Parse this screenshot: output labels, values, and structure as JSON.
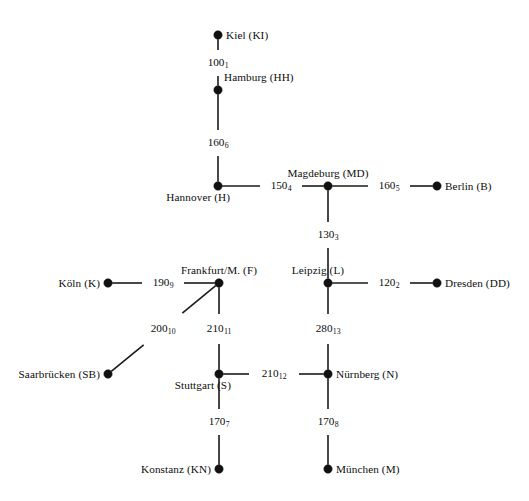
{
  "figure": {
    "kind": "undirected-weighted-graph",
    "width": 529,
    "height": 501,
    "background_color": "#ffffff",
    "line_color": "#1a1a1a",
    "node_color": "#111111",
    "text_color": "#0d0d0d"
  },
  "nodes": [
    {
      "id": "KI",
      "label": "Kiel (KI)",
      "x": 218,
      "y": 35,
      "label_pos": "right"
    },
    {
      "id": "HH",
      "label": "Hamburg (HH)",
      "x": 218,
      "y": 90,
      "label_pos": "right-above"
    },
    {
      "id": "H",
      "label": "Hannover (H)",
      "x": 218,
      "y": 186,
      "label_pos": "below-left"
    },
    {
      "id": "MD",
      "label": "Magdeburg (MD)",
      "x": 328,
      "y": 186,
      "label_pos": "above"
    },
    {
      "id": "B",
      "label": "Berlin (B)",
      "x": 437,
      "y": 186,
      "label_pos": "right"
    },
    {
      "id": "K",
      "label": "Köln (K)",
      "x": 108,
      "y": 283,
      "label_pos": "left"
    },
    {
      "id": "F",
      "label": "Frankfurt/M. (F)",
      "x": 219,
      "y": 283,
      "label_pos": "above"
    },
    {
      "id": "L",
      "label": "Leipzig (L)",
      "x": 328,
      "y": 283,
      "label_pos": "above-left"
    },
    {
      "id": "DD",
      "label": "Dresden (DD)",
      "x": 437,
      "y": 283,
      "label_pos": "right"
    },
    {
      "id": "SB",
      "label": "Saarbrücken (SB)",
      "x": 108,
      "y": 374,
      "label_pos": "left"
    },
    {
      "id": "S",
      "label": "Stuttgart (S)",
      "x": 219,
      "y": 374,
      "label_pos": "below-left"
    },
    {
      "id": "N",
      "label": "Nürnberg (N)",
      "x": 328,
      "y": 374,
      "label_pos": "right"
    },
    {
      "id": "KN",
      "label": "Konstanz (KN)",
      "x": 219,
      "y": 469,
      "label_pos": "left"
    },
    {
      "id": "M",
      "label": "München (M)",
      "x": 328,
      "y": 469,
      "label_pos": "right"
    }
  ],
  "edges": [
    {
      "index": 1,
      "from": "KI",
      "to": "HH",
      "weight": 100,
      "label": "100",
      "sub": "1",
      "label_x": 218,
      "label_y": 63
    },
    {
      "index": 6,
      "from": "HH",
      "to": "H",
      "weight": 160,
      "label": "160",
      "sub": "6",
      "label_x": 218,
      "label_y": 143
    },
    {
      "index": 4,
      "from": "H",
      "to": "MD",
      "weight": 150,
      "label": "150",
      "sub": "4",
      "label_x": 281,
      "label_y": 186
    },
    {
      "index": 5,
      "from": "MD",
      "to": "B",
      "weight": 160,
      "label": "160",
      "sub": "5",
      "label_x": 389,
      "label_y": 186
    },
    {
      "index": 3,
      "from": "MD",
      "to": "L",
      "weight": 130,
      "label": "130",
      "sub": "3",
      "label_x": 328,
      "label_y": 235
    },
    {
      "index": 9,
      "from": "K",
      "to": "F",
      "weight": 190,
      "label": "190",
      "sub": "9",
      "label_x": 163,
      "label_y": 283
    },
    {
      "index": 2,
      "from": "L",
      "to": "DD",
      "weight": 120,
      "label": "120",
      "sub": "2",
      "label_x": 389,
      "label_y": 283
    },
    {
      "index": 10,
      "from": "SB",
      "to": "F",
      "weight": 200,
      "label": "200",
      "sub": "10",
      "label_x": 163,
      "label_y": 329
    },
    {
      "index": 11,
      "from": "F",
      "to": "S",
      "weight": 210,
      "label": "210",
      "sub": "11",
      "label_x": 219,
      "label_y": 329
    },
    {
      "index": 13,
      "from": "L",
      "to": "N",
      "weight": 280,
      "label": "280",
      "sub": "13",
      "label_x": 328,
      "label_y": 329
    },
    {
      "index": 12,
      "from": "S",
      "to": "N",
      "weight": 210,
      "label": "210",
      "sub": "12",
      "label_x": 274,
      "label_y": 374
    },
    {
      "index": 7,
      "from": "S",
      "to": "KN",
      "weight": 170,
      "label": "170",
      "sub": "7",
      "label_x": 219,
      "label_y": 422
    },
    {
      "index": 8,
      "from": "N",
      "to": "M",
      "weight": 170,
      "label": "170",
      "sub": "8",
      "label_x": 328,
      "label_y": 422
    }
  ]
}
